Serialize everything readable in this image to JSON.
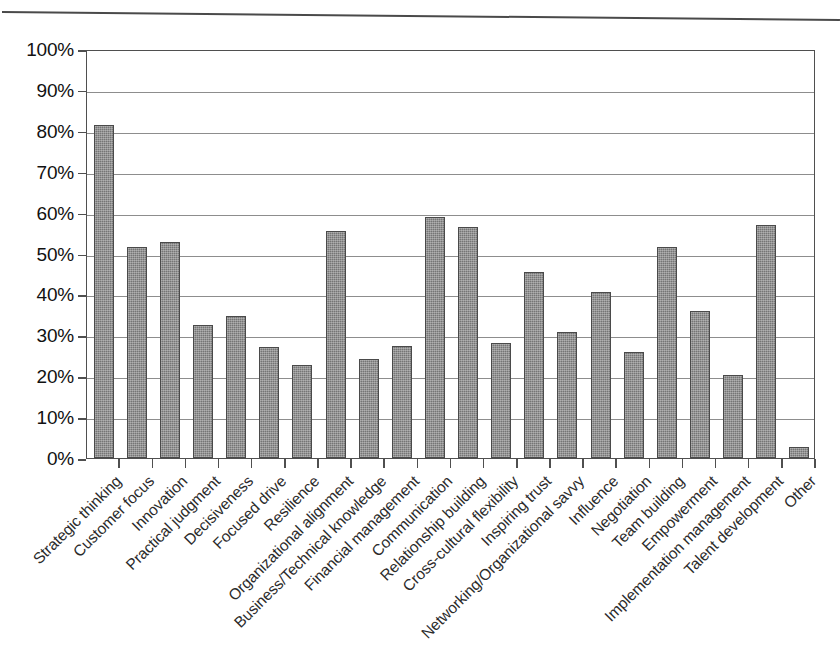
{
  "chart_data": {
    "type": "bar",
    "title": "",
    "subtitle": "",
    "xlabel": "",
    "ylabel": "",
    "ylim": [
      0,
      100
    ],
    "y_tick_labels": [
      "100%",
      "90%",
      "80%",
      "70%",
      "60%",
      "50%",
      "40%",
      "30%",
      "20%",
      "10%",
      "0%"
    ],
    "y_tick_values": [
      100,
      90,
      80,
      70,
      60,
      50,
      40,
      30,
      20,
      10,
      0
    ],
    "grid": true,
    "legend": false,
    "legend_position": "none",
    "bar_color": "#757575",
    "bar_edge_color": "#4a4a4a",
    "categories": [
      "Strategic thinking",
      "Customer focus",
      "Innovation",
      "Practical judgment",
      "Decisiveness",
      "Focused drive",
      "Resilience",
      "Organizational alignment",
      "Business/Technical knowledge",
      "Financial management",
      "Communication",
      "Relationship building",
      "Cross-cultural flexibility",
      "Inspiring trust",
      "Networking/Organizational savvy",
      "Influence",
      "Negotiation",
      "Team building",
      "Empowerment",
      "Implementation management",
      "Talent development",
      "Other"
    ],
    "values": [
      81.5,
      51.6,
      52.9,
      32.6,
      34.7,
      27.1,
      22.8,
      55.4,
      24.3,
      27.4,
      59.0,
      56.5,
      28.2,
      45.6,
      30.9,
      40.7,
      26.0,
      51.7,
      35.9,
      20.4,
      57.0,
      2.8
    ]
  },
  "figure": {
    "top_rule": "horizontal-rule"
  }
}
